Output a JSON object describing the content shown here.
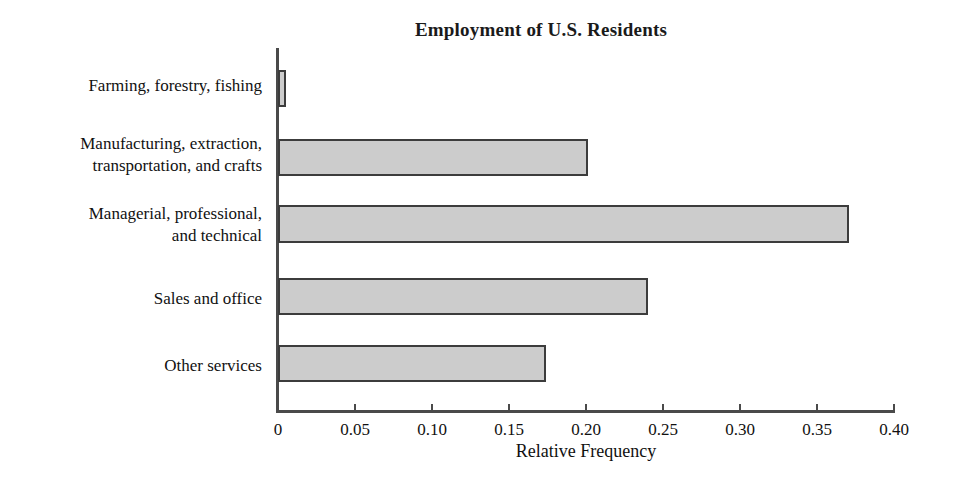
{
  "chart_data": {
    "type": "bar",
    "orientation": "horizontal",
    "title": "Employment of U.S. Residents",
    "xlabel": "Relative Frequency",
    "ylabel": "",
    "xlim": [
      0,
      0.4
    ],
    "xticks": [
      "0",
      "0.05",
      "0.10",
      "0.15",
      "0.20",
      "0.25",
      "0.30",
      "0.35",
      "0.40"
    ],
    "xtick_values": [
      0,
      0.05,
      0.1,
      0.15,
      0.2,
      0.25,
      0.3,
      0.35,
      0.4
    ],
    "grid": false,
    "legend": false,
    "categories": [
      "Farming, forestry, fishing",
      "Manufacturing, extraction,\ntransportation, and crafts",
      "Managerial, professional,\nand technical",
      "Sales and office",
      "Other services"
    ],
    "values": [
      0.005,
      0.201,
      0.371,
      0.24,
      0.174
    ],
    "bar_fill_color": "#cccccc",
    "bar_border_color": "#3c3c3c",
    "axis_color": "#4a4a4a",
    "background_color": "#ffffff"
  }
}
